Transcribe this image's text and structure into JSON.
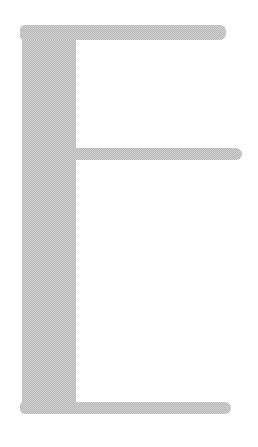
{
  "glyph": {
    "character": "E",
    "fill_color": "#cfcfcf",
    "dither_color": "#b9b9b9",
    "background": "#ffffff"
  }
}
